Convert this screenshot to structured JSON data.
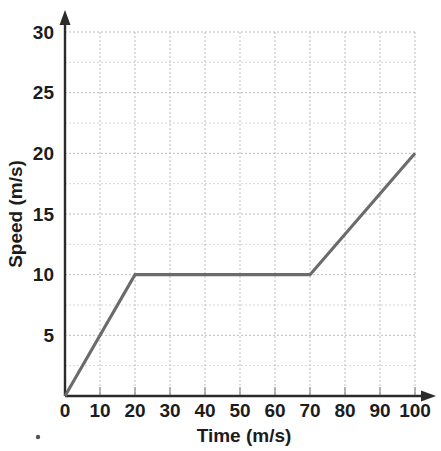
{
  "chart_data": {
    "type": "line",
    "title": "",
    "xlabel": "Time (m/s)",
    "ylabel": "Speed (m/s)",
    "xlim": [
      0,
      100
    ],
    "ylim": [
      0,
      30
    ],
    "grid": true,
    "legend": "none",
    "x_tick_labels": [
      "0",
      "10",
      "20",
      "30",
      "40",
      "50",
      "60",
      "70",
      "80",
      "90",
      "100"
    ],
    "x_ticks": [
      0,
      10,
      20,
      30,
      40,
      50,
      60,
      70,
      80,
      90,
      100
    ],
    "y_tick_labels": [
      "5",
      "10",
      "15",
      "20",
      "25",
      "30"
    ],
    "y_ticks": [
      5,
      10,
      15,
      20,
      25,
      30
    ],
    "y_minor_ticks": [
      2.5,
      7.5,
      12.5,
      17.5,
      22.5,
      27.5
    ],
    "series": [
      {
        "name": "Speed",
        "color": "#6b6b6b",
        "x": [
          0,
          20,
          70,
          100
        ],
        "values": [
          0,
          10,
          10,
          20
        ]
      }
    ],
    "segments": [
      {
        "from": [
          0,
          0
        ],
        "to": [
          20,
          10
        ],
        "description": "acceleration"
      },
      {
        "from": [
          20,
          10
        ],
        "to": [
          70,
          10
        ],
        "description": "constant speed"
      },
      {
        "from": [
          70,
          10
        ],
        "to": [
          100,
          20
        ],
        "description": "acceleration"
      }
    ]
  },
  "colors": {
    "axis": "#2b2b2b",
    "grid_major": "#bdbdbd",
    "grid_minor": "#d6d6d6",
    "data_line": "#6b6b6b",
    "text": "#1c1c1c",
    "background": "#ffffff"
  }
}
